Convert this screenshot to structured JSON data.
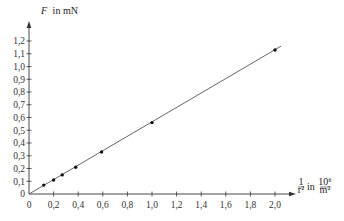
{
  "chart_data": {
    "type": "scatter",
    "title": "",
    "ylabel": "F in mN",
    "ylabel_var": "F",
    "ylabel_unit": "in mN",
    "xlabel": "1/r² in 10⁶/m²",
    "xlabel_frac_num": "1",
    "xlabel_frac_den": "r²",
    "xlabel_unit_text": "in",
    "xlabel_unit_num": "10⁶",
    "xlabel_unit_den": "m²",
    "xlim": [
      0,
      2.1
    ],
    "ylim": [
      0,
      1.25
    ],
    "grid": false,
    "legend": null,
    "x_ticks": [
      0,
      0.2,
      0.4,
      0.6,
      0.8,
      1.0,
      1.2,
      1.4,
      1.6,
      1.8,
      2.0
    ],
    "x_tick_labels": [
      "0",
      "0,2",
      "0,4",
      "0,6",
      "0,8",
      "1,0",
      "1,2",
      "1,4",
      "1,6",
      "1,8",
      "2,0"
    ],
    "y_ticks": [
      0,
      0.1,
      0.2,
      0.3,
      0.4,
      0.5,
      0.6,
      0.7,
      0.8,
      0.9,
      1.0,
      1.1,
      1.2
    ],
    "y_tick_labels": [
      "0",
      "0,1",
      "0,2",
      "0,3",
      "0,4",
      "0,5",
      "0,6",
      "0,7",
      "0,8",
      "0,9",
      "1,0",
      "1,1",
      "1,2"
    ],
    "series": [
      {
        "name": "Messwerte",
        "x": [
          0.12,
          0.2,
          0.27,
          0.38,
          0.59,
          1.0,
          2.0
        ],
        "y": [
          0.07,
          0.11,
          0.15,
          0.21,
          0.33,
          0.56,
          1.13
        ]
      }
    ],
    "fit_line": {
      "x": [
        0,
        2.05
      ],
      "y": [
        0,
        1.16
      ]
    },
    "colors": {
      "axis": "#333333",
      "line": "#555555",
      "point": "#111111"
    }
  }
}
